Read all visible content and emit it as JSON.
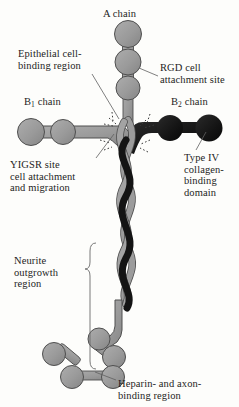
{
  "figure": {
    "type": "diagram",
    "colors": {
      "background": "#fdfdfb",
      "chain_light": "#9a9a9a",
      "chain_light_stroke": "#4f4f4f",
      "chain_dark": "#161616",
      "text": "#1d1d1d",
      "leader_line": "#5a5a5a"
    }
  },
  "labels": {
    "a_chain": "A chain",
    "epithelial": "Epithelial cell-\nbinding region",
    "rgd": "RGD cell\nattachment site",
    "b1_chain_pre": "B",
    "b1_chain_sub": "1",
    "b1_chain_post": " chain",
    "b2_chain_pre": "B",
    "b2_chain_sub": "2",
    "b2_chain_post": " chain",
    "yigsr": "YIGSR site\ncell attachment\nand migration",
    "type_iv": "Type IV\ncollagen-\nbinding\ndomain",
    "neurite": "Neurite\noutgrowth\nregion",
    "heparin": "Heparin- and axon-\nbinding region"
  },
  "structure": {
    "a_chain_globules": 3,
    "b1_chain_globules": 2,
    "b2_chain_globules": 2,
    "coiled_coil_strands": 3,
    "terminal_globules": 5
  }
}
